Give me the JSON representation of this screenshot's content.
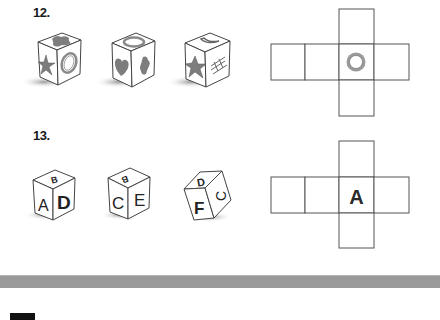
{
  "questions": [
    {
      "number": "12.",
      "cubes": [
        {
          "top": "cross-blob",
          "left": "star",
          "right": "ring"
        },
        {
          "top": "ring",
          "left": "heart",
          "right": "cross-blob"
        },
        {
          "top": "crescent",
          "left": "star",
          "right": "lattice"
        }
      ],
      "net": {
        "center_face": "ring"
      }
    },
    {
      "number": "13.",
      "cubes": [
        {
          "top": "B",
          "left": "A",
          "right": "D"
        },
        {
          "top": "B",
          "left": "C",
          "right": "E"
        },
        {
          "top": "D",
          "left": "F",
          "right": "C"
        }
      ],
      "net": {
        "center_face": "A"
      }
    }
  ],
  "colors": {
    "shape_fill": "#7d7d7d",
    "line": "#444444",
    "bar": "#9a9a9a"
  }
}
